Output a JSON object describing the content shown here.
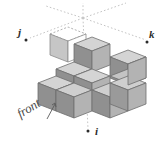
{
  "figure": {
    "type": "isometric-cube-diagram",
    "title": "",
    "background_color": "#ffffff",
    "axes": {
      "origin": {
        "x": 83,
        "y": 18
      },
      "style": "dotted",
      "line_color": "#b9b9b9",
      "items": [
        {
          "id": "j",
          "label": "j",
          "label_x": 18,
          "label_y": 27,
          "tip_x": 30,
          "tip_y": 38,
          "direction": "down-left"
        },
        {
          "id": "k",
          "label": "k",
          "label_x": 149,
          "label_y": 29,
          "tip_x": 146,
          "tip_y": 40,
          "direction": "down-right"
        },
        {
          "id": "i",
          "label": "i",
          "label_x": 95,
          "label_y": 126,
          "tip_x": 88,
          "tip_y": 130,
          "direction": "down"
        }
      ]
    },
    "annotations": [
      {
        "id": "front",
        "text": "front",
        "x": 14,
        "y": 108,
        "rotation_deg": -31,
        "color": "#4a4a4a",
        "has_pointer_arrow": true
      }
    ],
    "cubes": {
      "face_colors": {
        "top": "#d0d0d0",
        "left": "#8e8e8e",
        "right": "#b0b0b0",
        "edge": "#6b6b6b"
      },
      "ghost_cube": {
        "label": "dashed-outline-cube",
        "top_face": "#ffffff",
        "left_face": "#c9c9c9",
        "right_face": "#ffffff",
        "edge_style": "dashed",
        "edge_color": "#9a9a9a",
        "count": 1
      },
      "solid_count": 9,
      "arrangement": "L-shaped stack of unit cubes on a 3x2 base with two cubes on the upper layer"
    }
  }
}
